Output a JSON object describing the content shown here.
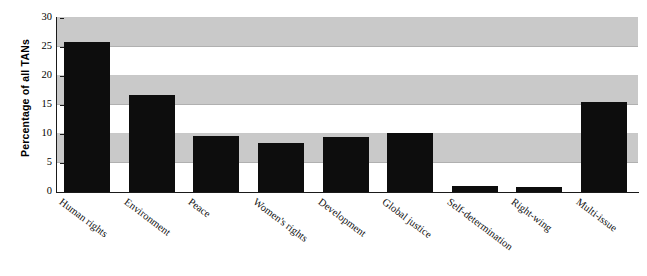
{
  "chart_data": {
    "type": "bar",
    "title": "",
    "xlabel": "",
    "ylabel": "Percentage of all TANs",
    "ylim": [
      0,
      30
    ],
    "ytick_labels": [
      "0",
      "5",
      "10",
      "15",
      "20",
      "25",
      "30"
    ],
    "yticks": [
      0,
      5,
      10,
      15,
      20,
      25,
      30
    ],
    "grid": "horizontal alternating gray bands",
    "legend": "none",
    "bar_color": "#0d0d0d",
    "band_color": "#c9c9c9",
    "categories": [
      "Human rights",
      "Environment",
      "Peace",
      "Women's rights",
      "Development",
      "Global justice",
      "Self-determination",
      "Right-wing",
      "Multi-issue"
    ],
    "values": [
      25.9,
      16.7,
      9.7,
      8.4,
      9.4,
      10.2,
      1.0,
      0.9,
      15.6
    ]
  }
}
